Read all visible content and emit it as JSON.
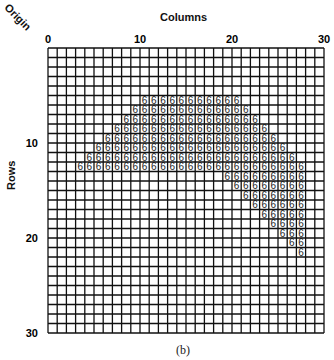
{
  "figure": {
    "caption": "(b)",
    "origin_label": "Origin",
    "x_axis_title": "Columns",
    "y_axis_title": "Rows",
    "x_ticks": [
      {
        "value": 0,
        "label": "0"
      },
      {
        "value": 10,
        "label": "10"
      },
      {
        "value": 20,
        "label": "20"
      },
      {
        "value": 30,
        "label": "30"
      }
    ],
    "y_ticks": [
      {
        "value": 10,
        "label": "10"
      },
      {
        "value": 20,
        "label": "20"
      },
      {
        "value": 30,
        "label": "30"
      }
    ],
    "grid": {
      "columns": 30,
      "rows": 30,
      "line_color": "#111111",
      "cell_value": "6",
      "filled_runs": [
        {
          "row": 5,
          "col_start": 10,
          "col_end": 20
        },
        {
          "row": 6,
          "col_start": 9,
          "col_end": 21
        },
        {
          "row": 7,
          "col_start": 8,
          "col_end": 22
        },
        {
          "row": 8,
          "col_start": 7,
          "col_end": 23
        },
        {
          "row": 9,
          "col_start": 6,
          "col_end": 24
        },
        {
          "row": 10,
          "col_start": 5,
          "col_end": 25
        },
        {
          "row": 11,
          "col_start": 4,
          "col_end": 26
        },
        {
          "row": 12,
          "col_start": 3,
          "col_end": 27
        },
        {
          "row": 13,
          "col_start": 19,
          "col_end": 27
        },
        {
          "row": 14,
          "col_start": 20,
          "col_end": 27
        },
        {
          "row": 15,
          "col_start": 21,
          "col_end": 27
        },
        {
          "row": 16,
          "col_start": 22,
          "col_end": 27
        },
        {
          "row": 17,
          "col_start": 23,
          "col_end": 27
        },
        {
          "row": 18,
          "col_start": 24,
          "col_end": 27
        },
        {
          "row": 19,
          "col_start": 25,
          "col_end": 27
        },
        {
          "row": 20,
          "col_start": 26,
          "col_end": 27
        },
        {
          "row": 21,
          "col_start": 27,
          "col_end": 27
        }
      ]
    }
  }
}
